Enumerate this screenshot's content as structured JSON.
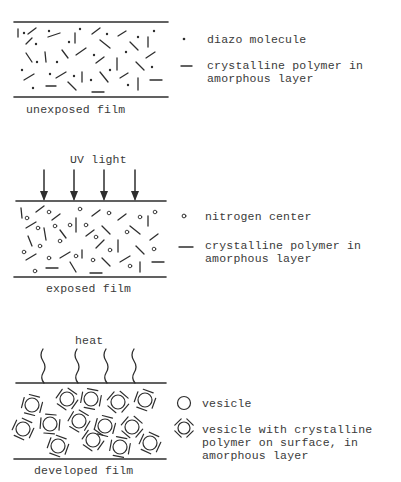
{
  "panels": [
    {
      "id": "unexposed",
      "caption": "unexposed film",
      "legend": [
        {
          "symbol": "dot",
          "text": "diazo molecule"
        },
        {
          "symbol": "dash",
          "line1": "crystalline polymer in",
          "line2": "amorphous layer"
        }
      ]
    },
    {
      "id": "exposed",
      "stimulus": "UV light",
      "caption": "exposed film",
      "legend": [
        {
          "symbol": "small-circle",
          "text": "nitrogen center"
        },
        {
          "symbol": "dash",
          "line1": "crystalline polymer in",
          "line2": "amorphous layer"
        }
      ]
    },
    {
      "id": "developed",
      "stimulus": "heat",
      "caption": "developed film",
      "legend": [
        {
          "symbol": "circle",
          "text": "vesicle"
        },
        {
          "symbol": "circle-with-dashes",
          "line1": "vesicle with crystalline",
          "line2": "polymer on surface, in",
          "line3": "amorphous layer"
        }
      ]
    }
  ],
  "colors": {
    "ink": "#2e2e2e",
    "background": "#ffffff"
  }
}
